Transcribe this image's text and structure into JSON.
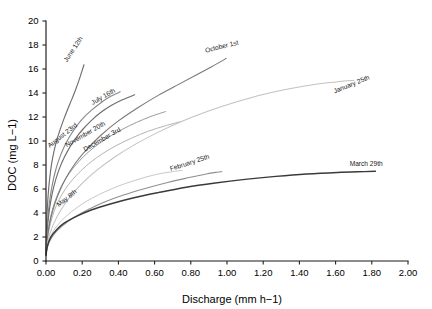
{
  "chart_data": {
    "type": "line",
    "title": "",
    "xlabel": "Discharge (mm h−1)",
    "ylabel": "DOC (mg L−1)",
    "xlim": [
      0.0,
      2.0
    ],
    "ylim": [
      0,
      20
    ],
    "xticks": [
      "0.00",
      "0.20",
      "0.40",
      "0.60",
      "0.80",
      "1.00",
      "1.20",
      "1.40",
      "1.60",
      "1.80",
      "2.00"
    ],
    "xtick_values": [
      0.0,
      0.2,
      0.4,
      0.6,
      0.8,
      1.0,
      1.2,
      1.4,
      1.6,
      1.8,
      2.0
    ],
    "yticks": [
      "0",
      "2",
      "4",
      "6",
      "8",
      "10",
      "12",
      "14",
      "16",
      "18",
      "20"
    ],
    "ytick_values": [
      0,
      2,
      4,
      6,
      8,
      10,
      12,
      14,
      16,
      18,
      20
    ],
    "grid": false,
    "legend": "inline-curve-labels",
    "series": [
      {
        "name": "June 12th",
        "color": "#6e6e6e",
        "width": 1.15,
        "label_x": 0.205,
        "label_y": 18.55,
        "label_angle": -56,
        "points": [
          [
            0.0,
            0.5
          ],
          [
            0.004,
            3.2
          ],
          [
            0.008,
            4.6
          ],
          [
            0.014,
            5.9
          ],
          [
            0.022,
            7.1
          ],
          [
            0.032,
            8.2
          ],
          [
            0.045,
            9.2
          ],
          [
            0.06,
            10.1
          ],
          [
            0.078,
            10.95
          ],
          [
            0.098,
            11.8
          ],
          [
            0.12,
            12.65
          ],
          [
            0.142,
            13.45
          ],
          [
            0.163,
            14.25
          ],
          [
            0.182,
            15.05
          ],
          [
            0.198,
            15.8
          ],
          [
            0.21,
            16.35
          ]
        ]
      },
      {
        "name": "July 16th",
        "color": "#8a8a8a",
        "width": 1.15,
        "label_x": 0.385,
        "label_y": 14.1,
        "label_angle": -30,
        "points": [
          [
            0.0,
            0.5
          ],
          [
            0.004,
            2.2
          ],
          [
            0.01,
            3.6
          ],
          [
            0.02,
            5.0
          ],
          [
            0.034,
            6.3
          ],
          [
            0.052,
            7.5
          ],
          [
            0.074,
            8.55
          ],
          [
            0.1,
            9.5
          ],
          [
            0.13,
            10.35
          ],
          [
            0.165,
            11.15
          ],
          [
            0.205,
            11.9
          ],
          [
            0.25,
            12.55
          ],
          [
            0.3,
            13.15
          ],
          [
            0.355,
            13.7
          ],
          [
            0.41,
            14.1
          ]
        ]
      },
      {
        "name": "August 23rd",
        "color": "#6e6e6e",
        "width": 1.15,
        "label_x": 0.175,
        "label_y": 11.25,
        "label_angle": -38,
        "points": [
          [
            0.0,
            0.5
          ],
          [
            0.004,
            1.9
          ],
          [
            0.01,
            3.1
          ],
          [
            0.02,
            4.4
          ],
          [
            0.034,
            5.6
          ],
          [
            0.052,
            6.7
          ],
          [
            0.074,
            7.7
          ],
          [
            0.1,
            8.6
          ],
          [
            0.13,
            9.45
          ],
          [
            0.165,
            10.25
          ],
          [
            0.205,
            11.0
          ],
          [
            0.25,
            11.7
          ],
          [
            0.3,
            12.35
          ],
          [
            0.36,
            12.95
          ],
          [
            0.425,
            13.45
          ],
          [
            0.49,
            13.85
          ]
        ]
      },
      {
        "name": "November 20th",
        "color": "#9a9a9a",
        "width": 1.0,
        "label_x": 0.33,
        "label_y": 11.35,
        "label_angle": -30,
        "points": [
          [
            0.0,
            0.5
          ],
          [
            0.004,
            1.55
          ],
          [
            0.012,
            2.55
          ],
          [
            0.025,
            3.65
          ],
          [
            0.045,
            4.75
          ],
          [
            0.07,
            5.75
          ],
          [
            0.1,
            6.65
          ],
          [
            0.138,
            7.5
          ],
          [
            0.182,
            8.3
          ],
          [
            0.232,
            9.05
          ],
          [
            0.29,
            9.75
          ],
          [
            0.355,
            10.4
          ],
          [
            0.425,
            11.0
          ],
          [
            0.5,
            11.55
          ],
          [
            0.58,
            12.05
          ],
          [
            0.66,
            12.45
          ]
        ]
      },
      {
        "name": "December 3rd",
        "color": "#b4b4b4",
        "width": 1.0,
        "label_x": 0.415,
        "label_y": 10.85,
        "label_angle": -30,
        "points": [
          [
            0.0,
            0.5
          ],
          [
            0.004,
            1.35
          ],
          [
            0.012,
            2.2
          ],
          [
            0.025,
            3.15
          ],
          [
            0.045,
            4.15
          ],
          [
            0.072,
            5.1
          ],
          [
            0.105,
            5.95
          ],
          [
            0.145,
            6.75
          ],
          [
            0.195,
            7.55
          ],
          [
            0.252,
            8.3
          ],
          [
            0.318,
            9.0
          ],
          [
            0.392,
            9.65
          ],
          [
            0.474,
            10.25
          ],
          [
            0.562,
            10.8
          ],
          [
            0.655,
            11.25
          ],
          [
            0.74,
            11.6
          ]
        ]
      },
      {
        "name": "October 1st",
        "color": "#787878",
        "width": 1.05,
        "label_x": 1.065,
        "label_y": 18.05,
        "label_angle": -14,
        "points": [
          [
            0.0,
            0.5
          ],
          [
            0.006,
            1.7
          ],
          [
            0.018,
            2.95
          ],
          [
            0.038,
            4.25
          ],
          [
            0.068,
            5.55
          ],
          [
            0.108,
            6.85
          ],
          [
            0.16,
            8.1
          ],
          [
            0.225,
            9.3
          ],
          [
            0.305,
            10.5
          ],
          [
            0.398,
            11.65
          ],
          [
            0.505,
            12.75
          ],
          [
            0.62,
            13.8
          ],
          [
            0.73,
            14.7
          ],
          [
            0.83,
            15.5
          ],
          [
            0.91,
            16.15
          ],
          [
            0.975,
            16.7
          ],
          [
            0.995,
            16.9
          ]
        ]
      },
      {
        "name": "January 25th",
        "color": "#c2c2c2",
        "width": 1.05,
        "label_x": 1.79,
        "label_y": 15.15,
        "label_angle": -22,
        "points": [
          [
            0.0,
            0.5
          ],
          [
            0.006,
            1.3
          ],
          [
            0.02,
            2.2
          ],
          [
            0.045,
            3.2
          ],
          [
            0.082,
            4.25
          ],
          [
            0.132,
            5.35
          ],
          [
            0.198,
            6.45
          ],
          [
            0.28,
            7.55
          ],
          [
            0.378,
            8.65
          ],
          [
            0.49,
            9.7
          ],
          [
            0.615,
            10.7
          ],
          [
            0.752,
            11.65
          ],
          [
            0.898,
            12.5
          ],
          [
            1.05,
            13.25
          ],
          [
            1.205,
            13.9
          ],
          [
            1.36,
            14.4
          ],
          [
            1.5,
            14.75
          ],
          [
            1.62,
            14.95
          ],
          [
            1.7,
            15.05
          ]
        ]
      },
      {
        "name": "May 8th",
        "color": "#c8c8c8",
        "width": 1.0,
        "label_x": 0.172,
        "label_y": 5.7,
        "label_angle": -38,
        "points": [
          [
            0.0,
            0.5
          ],
          [
            0.006,
            1.15
          ],
          [
            0.02,
            1.85
          ],
          [
            0.045,
            2.6
          ],
          [
            0.085,
            3.35
          ],
          [
            0.14,
            4.1
          ],
          [
            0.21,
            4.85
          ],
          [
            0.295,
            5.55
          ],
          [
            0.392,
            6.2
          ],
          [
            0.498,
            6.75
          ],
          [
            0.605,
            7.2
          ],
          [
            0.7,
            7.45
          ],
          [
            0.752,
            7.55
          ]
        ]
      },
      {
        "name": "February 25th",
        "color": "#8f8f8f",
        "width": 1.05,
        "label_x": 0.905,
        "label_y": 8.55,
        "label_angle": -18,
        "points": [
          [
            0.0,
            0.5
          ],
          [
            0.006,
            1.05
          ],
          [
            0.02,
            1.65
          ],
          [
            0.048,
            2.3
          ],
          [
            0.092,
            2.95
          ],
          [
            0.152,
            3.6
          ],
          [
            0.228,
            4.25
          ],
          [
            0.32,
            4.9
          ],
          [
            0.428,
            5.5
          ],
          [
            0.548,
            6.05
          ],
          [
            0.672,
            6.55
          ],
          [
            0.79,
            6.95
          ],
          [
            0.885,
            7.25
          ],
          [
            0.945,
            7.4
          ],
          [
            0.972,
            7.45
          ]
        ]
      },
      {
        "name": "March 29th",
        "color": "#3a3a3a",
        "width": 1.45,
        "label_x": 1.86,
        "label_y": 7.95,
        "label_angle": 0,
        "points": [
          [
            0.0,
            0.5
          ],
          [
            0.008,
            1.25
          ],
          [
            0.025,
            1.95
          ],
          [
            0.055,
            2.55
          ],
          [
            0.1,
            3.15
          ],
          [
            0.165,
            3.7
          ],
          [
            0.25,
            4.25
          ],
          [
            0.355,
            4.75
          ],
          [
            0.48,
            5.25
          ],
          [
            0.62,
            5.7
          ],
          [
            0.775,
            6.15
          ],
          [
            0.935,
            6.5
          ],
          [
            1.1,
            6.8
          ],
          [
            1.27,
            7.05
          ],
          [
            1.44,
            7.25
          ],
          [
            1.61,
            7.38
          ],
          [
            1.76,
            7.45
          ],
          [
            1.82,
            7.48
          ]
        ]
      }
    ]
  }
}
